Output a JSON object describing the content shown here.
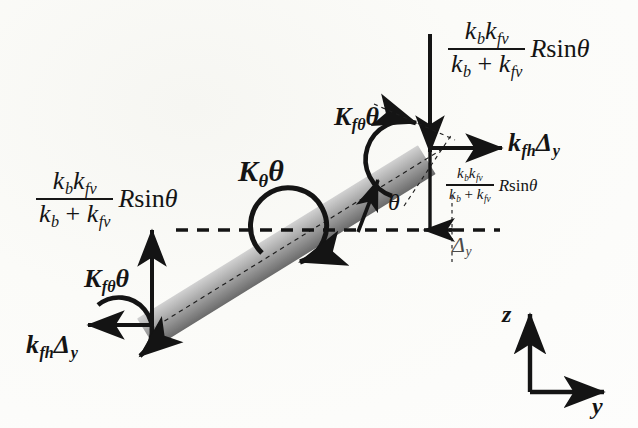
{
  "diagram": {
    "background_color": "#fdfdfb",
    "ink_color": "#141414",
    "beam": {
      "fill_light": "#c9c9c9",
      "fill_dark": "#6f6f6f",
      "angle_deg": 31.7,
      "start": [
        152,
        325
      ],
      "end": [
        432,
        152
      ]
    }
  },
  "symbols": {
    "k": "k",
    "K": "K",
    "R": "R",
    "sin": "sin",
    "theta": "θ",
    "delta": "Δ",
    "plus": "+",
    "sub_b": "b",
    "sub_fv": "fv",
    "sub_fh": "fh",
    "sub_ftheta": "fθ",
    "sub_y": "y"
  },
  "labels": {
    "vertical_force_top_right": {
      "name": "k_b k_fv / (k_b + k_fv) R sin theta",
      "numerator": "k_b k_fv",
      "denominator": "k_b + k_fv",
      "tail": "R sin θ"
    },
    "vertical_force_left": {
      "name": "k_b k_fv / (k_b + k_fv) R sin theta",
      "numerator": "k_b k_fv",
      "denominator": "k_b + k_fv",
      "tail": "R sin θ"
    },
    "vertical_force_right_small": {
      "name": "k_b k_fv / (k_b + k_fv) R sin theta",
      "numerator": "k_b k_fv",
      "denominator": "k_b + k_fv",
      "tail": "R sin θ"
    },
    "horizontal_force_right": "k_fh Δ_y",
    "horizontal_force_left": "k_fh Δ_y",
    "moment_node_right": "K_fθ θ",
    "moment_node_left": "K_fθ θ",
    "moment_center": "K_θ θ",
    "angle": "θ",
    "displacement": "Δ_y",
    "axis_z": "z",
    "axis_y": "y"
  },
  "annotations": {
    "reference_line": "horizontal dashed datum",
    "beam_centerline": "dotted axis of beam",
    "delta_guide": "dotted vertical guide at right node"
  }
}
